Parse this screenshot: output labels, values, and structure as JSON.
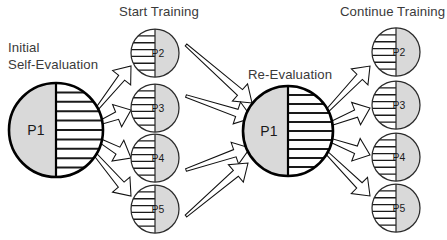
{
  "diagram": {
    "background_color": "#ffffff",
    "colors": {
      "gray_fill": "#d9d9d9",
      "stripe_line": "#1a1a1a",
      "outline": "#000000",
      "label_text": "#3a3a3a",
      "node_text": "#1a1a1a",
      "arrow_fill": "#ffffff",
      "arrow_stroke": "#111111"
    },
    "stage_labels": [
      {
        "id": "initial-self-evaluation",
        "line1": "Initial",
        "line2": "Self-Evaluation",
        "x": 8,
        "y": 52
      },
      {
        "id": "start-training",
        "text": "Start Training",
        "x": 119,
        "y": 16
      },
      {
        "id": "re-evaluation",
        "text": "Re-Evaluation",
        "x": 248,
        "y": 79
      },
      {
        "id": "continue-training",
        "text": "Continue Training",
        "x": 340,
        "y": 16
      }
    ],
    "big_nodes": [
      {
        "id": "p1-initial",
        "label": "P1",
        "cx": 56,
        "cy": 130,
        "r": 47,
        "gray_side": "left",
        "stripe_side": "right",
        "stripe_count": 9,
        "label_x": 36,
        "label_y": 135
      },
      {
        "id": "p1-reevaluation",
        "label": "P1",
        "cx": 288,
        "cy": 131,
        "r": 45,
        "gray_side": "left",
        "stripe_side": "right",
        "stripe_count": 9,
        "label_x": 269,
        "label_y": 136
      }
    ],
    "small_nodes_column1": [
      {
        "id": "start-p2",
        "label": "P2",
        "cx": 155,
        "cy": 53,
        "r": 24,
        "gray_side": "right",
        "stripe_side": "left",
        "stripe_count": 6,
        "label_x": 158,
        "label_y": 57
      },
      {
        "id": "start-p3",
        "label": "P3",
        "cx": 155,
        "cy": 108,
        "r": 24,
        "gray_side": "right",
        "stripe_side": "left",
        "stripe_count": 6,
        "label_x": 158,
        "label_y": 112
      },
      {
        "id": "start-p4",
        "label": "P4",
        "cx": 155,
        "cy": 158,
        "r": 24,
        "gray_side": "right",
        "stripe_side": "left",
        "stripe_count": 6,
        "label_x": 158,
        "label_y": 162
      },
      {
        "id": "start-p5",
        "label": "P5",
        "cx": 155,
        "cy": 209,
        "r": 24,
        "gray_side": "right",
        "stripe_side": "left",
        "stripe_count": 6,
        "label_x": 158,
        "label_y": 213
      }
    ],
    "small_nodes_column2": [
      {
        "id": "continue-p2",
        "label": "P2",
        "cx": 396,
        "cy": 52,
        "r": 24,
        "gray_side": "right",
        "stripe_side": "left",
        "stripe_count": 6,
        "label_x": 399,
        "label_y": 56
      },
      {
        "id": "continue-p3",
        "label": "P3",
        "cx": 396,
        "cy": 105,
        "r": 24,
        "gray_side": "right",
        "stripe_side": "left",
        "stripe_count": 6,
        "label_x": 399,
        "label_y": 109
      },
      {
        "id": "continue-p4",
        "label": "P4",
        "cx": 396,
        "cy": 157,
        "r": 24,
        "gray_side": "right",
        "stripe_side": "left",
        "stripe_count": 6,
        "label_x": 399,
        "label_y": 161
      },
      {
        "id": "continue-p5",
        "label": "P5",
        "cx": 396,
        "cy": 208,
        "r": 24,
        "gray_side": "right",
        "stripe_side": "left",
        "stripe_count": 6,
        "label_x": 399,
        "label_y": 212
      }
    ],
    "arrows": [
      {
        "id": "arrow-p1-to-start-p2",
        "group": "fanout-left",
        "x1": 96,
        "y1": 110,
        "x2": 131,
        "y2": 66,
        "tail_w": 1.4,
        "head_w": 11.5,
        "head_len": 15
      },
      {
        "id": "arrow-p1-to-start-p3",
        "group": "fanout-left",
        "x1": 99,
        "y1": 123,
        "x2": 131,
        "y2": 110,
        "tail_w": 1.8,
        "head_w": 12,
        "head_len": 15
      },
      {
        "id": "arrow-p1-to-start-p4",
        "group": "fanout-left",
        "x1": 99,
        "y1": 140,
        "x2": 131,
        "y2": 158,
        "tail_w": 1.8,
        "head_w": 12,
        "head_len": 15
      },
      {
        "id": "arrow-p1-to-start-p5",
        "group": "fanout-left",
        "x1": 94,
        "y1": 153,
        "x2": 131,
        "y2": 196,
        "tail_w": 1.6,
        "head_w": 11.5,
        "head_len": 15
      },
      {
        "id": "arrow-start-p2-to-p1",
        "group": "converge-middle",
        "x1": 186,
        "y1": 45,
        "x2": 252,
        "y2": 103,
        "tail_w": 1.2,
        "head_w": 11.5,
        "head_len": 16
      },
      {
        "id": "arrow-start-p3-to-p1",
        "group": "converge-middle",
        "x1": 186,
        "y1": 96,
        "x2": 252,
        "y2": 118,
        "tail_w": 1.2,
        "head_w": 11.5,
        "head_len": 16
      },
      {
        "id": "arrow-start-p4-to-p1",
        "group": "converge-middle",
        "x1": 186,
        "y1": 170,
        "x2": 250,
        "y2": 148,
        "tail_w": 1.2,
        "head_w": 11.5,
        "head_len": 16
      },
      {
        "id": "arrow-start-p5-to-p1",
        "group": "converge-middle",
        "x1": 186,
        "y1": 216,
        "x2": 248,
        "y2": 163,
        "tail_w": 1.2,
        "head_w": 11.5,
        "head_len": 16
      },
      {
        "id": "arrow-p1-to-continue-p2",
        "group": "fanout-right",
        "x1": 326,
        "y1": 112,
        "x2": 370,
        "y2": 66,
        "tail_w": 1.5,
        "head_w": 11.5,
        "head_len": 15
      },
      {
        "id": "arrow-p1-to-continue-p3",
        "group": "fanout-right",
        "x1": 330,
        "y1": 124,
        "x2": 370,
        "y2": 108,
        "tail_w": 1.8,
        "head_w": 12,
        "head_len": 15
      },
      {
        "id": "arrow-p1-to-continue-p4",
        "group": "fanout-right",
        "x1": 330,
        "y1": 140,
        "x2": 370,
        "y2": 155,
        "tail_w": 1.8,
        "head_w": 12,
        "head_len": 15
      },
      {
        "id": "arrow-p1-to-continue-p5",
        "group": "fanout-right",
        "x1": 326,
        "y1": 152,
        "x2": 370,
        "y2": 196,
        "tail_w": 1.5,
        "head_w": 11.5,
        "head_len": 15
      }
    ]
  }
}
